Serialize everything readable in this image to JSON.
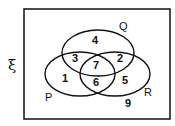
{
  "diagram": {
    "type": "venn",
    "universal_symbol": "ξ",
    "sets": [
      {
        "name": "P"
      },
      {
        "name": "Q"
      },
      {
        "name": "R"
      }
    ],
    "regions": {
      "P_only": "1",
      "Q_only": "4",
      "R_only": "5",
      "P_and_Q_only": "3",
      "Q_and_R_only": "2",
      "P_and_R_only": "6",
      "P_Q_R": "7",
      "outside": "9"
    }
  }
}
